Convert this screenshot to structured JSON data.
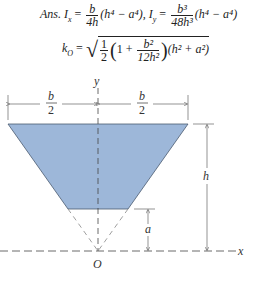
{
  "answer": {
    "prefix": "Ans.",
    "ix_lhs": "I",
    "ix_sub": "x",
    "ix_num": "b",
    "ix_den": "4h",
    "ix_rest": "(h⁴ − a⁴),",
    "iy_lhs": "I",
    "iy_sub": "y",
    "iy_num": "b³",
    "iy_den": "48h³",
    "iy_rest": "(h⁴ − a⁴)",
    "ko_lhs": "k",
    "ko_sub": "O",
    "ko_half_num": "1",
    "ko_half_den": "2",
    "ko_inner_one": "1 +",
    "ko_inner_num": "b²",
    "ko_inner_den": "12h²",
    "ko_tail": "(h² + a²)",
    "equals": "="
  },
  "figure": {
    "fill_color": "#9db7d9",
    "labels": {
      "y_axis": "y",
      "x_axis": "x",
      "origin": "O",
      "half_width_num": "b",
      "half_width_den": "2",
      "height": "h",
      "offset": "a"
    }
  }
}
